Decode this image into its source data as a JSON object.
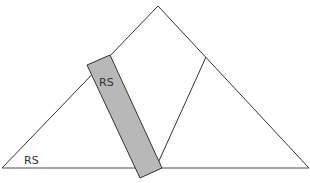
{
  "diagram": {
    "type": "triangle-with-rotated-strip",
    "colors": {
      "background": "#ffffff",
      "outline": "#333333",
      "baseline": "#888888",
      "strip_fill": "#b8b8b8"
    },
    "labels": {
      "strip_label": "RS",
      "corner_label": "RS"
    }
  }
}
